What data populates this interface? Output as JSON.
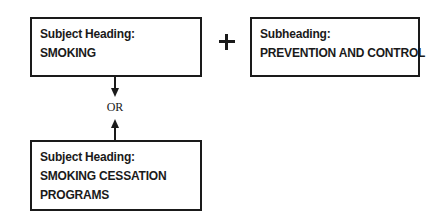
{
  "diagram": {
    "boxes": {
      "smoking": {
        "label": "Subject Heading:",
        "value": "SMOKING"
      },
      "subheading": {
        "label": "Subheading:",
        "value": "PREVENTION AND CONTROL"
      },
      "cessation": {
        "label": "Subject Heading:",
        "value_line1": "SMOKING CESSATION",
        "value_line2": "PROGRAMS"
      }
    },
    "connectors": {
      "combine_symbol": "+",
      "alternative_label": "OR"
    },
    "colors": {
      "line": "#1a1a1a",
      "background": "#ffffff"
    }
  }
}
